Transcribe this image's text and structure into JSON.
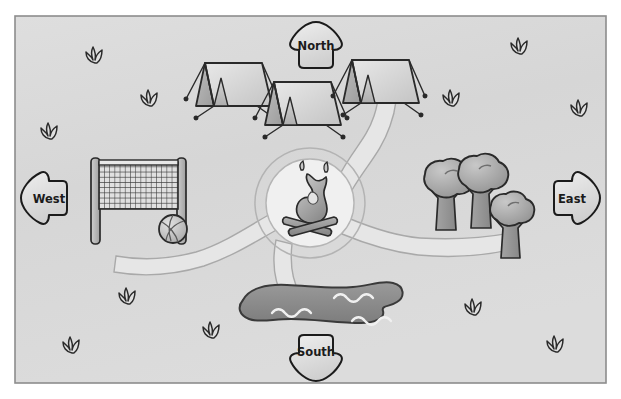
{
  "map": {
    "title": "Campground Map",
    "background_color": "#d8d8d8",
    "border_color": "#8d8d8d",
    "canvas": {
      "width": 621,
      "height": 399
    },
    "frame": {
      "x": 15,
      "y": 16,
      "width": 591,
      "height": 367
    }
  },
  "compass": {
    "north": {
      "label": "North",
      "x": 316,
      "y": 45,
      "direction": "up"
    },
    "south": {
      "label": "South",
      "x": 316,
      "y": 355,
      "direction": "down"
    },
    "east": {
      "label": "East",
      "x": 573,
      "y": 198,
      "direction": "right"
    },
    "west": {
      "label": "West",
      "x": 47,
      "y": 198,
      "direction": "left"
    },
    "fill": "#e3e3e3",
    "stroke": "#1b1b1b"
  },
  "features": {
    "campfire": {
      "name": "campfire",
      "label": "Campfire",
      "x": 310,
      "y": 203,
      "clearing_radius": 45,
      "flame_color": "#b4b4b4",
      "log_color": "#9a9a9a"
    },
    "tents": [
      {
        "name": "tent-west",
        "x": 232,
        "y": 78,
        "scale": 1.0
      },
      {
        "name": "tent-center",
        "x": 300,
        "y": 97,
        "scale": 1.0
      },
      {
        "name": "tent-east",
        "x": 378,
        "y": 75,
        "scale": 1.0
      }
    ],
    "trees": [
      {
        "name": "tree-left",
        "x": 440,
        "y": 196,
        "scale": 1.0
      },
      {
        "name": "tree-middle",
        "x": 473,
        "y": 190,
        "scale": 1.0
      },
      {
        "name": "tree-right",
        "x": 503,
        "y": 218,
        "scale": 0.88
      }
    ],
    "volleyball": {
      "name": "volleyball-court",
      "label": "Volleyball net",
      "net": {
        "x": 96,
        "y": 160,
        "width": 86,
        "height": 52
      },
      "ball": {
        "x": 173,
        "y": 229,
        "r": 14
      }
    },
    "lake": {
      "name": "lake",
      "label": "Lake",
      "x": 235,
      "y": 288,
      "width": 160,
      "height": 48,
      "fill": "#8e8e8e",
      "wave_color": "#f2f2f2",
      "waves": 3
    },
    "paths": {
      "name": "trail-network",
      "fill": "#e4e4e4",
      "stroke": "#a9a9a9",
      "count": 4
    },
    "grass_tufts": [
      {
        "x": 95,
        "y": 55
      },
      {
        "x": 150,
        "y": 98
      },
      {
        "x": 50,
        "y": 131
      },
      {
        "x": 128,
        "y": 296
      },
      {
        "x": 212,
        "y": 330
      },
      {
        "x": 72,
        "y": 345
      },
      {
        "x": 520,
        "y": 46
      },
      {
        "x": 452,
        "y": 98
      },
      {
        "x": 580,
        "y": 108
      },
      {
        "x": 474,
        "y": 307
      },
      {
        "x": 556,
        "y": 344
      }
    ]
  },
  "colors": {
    "ink": "#1b1b1b",
    "canvas_fill": "#d8d8d8",
    "light_fill": "#ececec",
    "mid_fill": "#b8b8b8",
    "dark_fill": "#8e8e8e"
  }
}
